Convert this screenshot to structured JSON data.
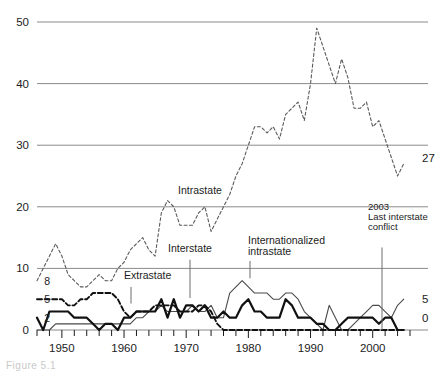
{
  "figure": {
    "caption": "Figure  5.1"
  },
  "chart_data": {
    "type": "line",
    "title": "",
    "xlabel": "",
    "ylabel": "",
    "xlim": [
      1946,
      2006
    ],
    "ylim": [
      0,
      50
    ],
    "grid": true,
    "gridlines_y": [
      0,
      10,
      20,
      30,
      40,
      50
    ],
    "legend_position": "inline-annotations",
    "y_tick_labels": [
      "50",
      "40",
      "30",
      "20",
      "10",
      "0"
    ],
    "y_minor_labels": [
      "8",
      "5",
      "2"
    ],
    "x_tick_labels": [
      "1950",
      "1960",
      "1970",
      "1980",
      "1990",
      "2000"
    ],
    "x_tick_interval_years": 2,
    "end_labels": [
      {
        "series": "Intrastate",
        "value": "27"
      },
      {
        "series": "Internationalized intrastate",
        "value": "5"
      },
      {
        "series": "Interstate",
        "value": "0"
      }
    ],
    "start_labels": [
      {
        "series": "Intrastate",
        "value": "8"
      },
      {
        "series": "Extrastate",
        "value": "5"
      },
      {
        "series": "Interstate",
        "value": "2"
      }
    ],
    "annotations": [
      {
        "name": "intrastate-label",
        "text": "Intrastate",
        "x": 1967,
        "y": 22.0
      },
      {
        "name": "interstate-label",
        "text": "Interstate",
        "x": 1969,
        "y": 12.5
      },
      {
        "name": "internationalized-intrastate-label",
        "text": "Internationalized\nintrastate",
        "x": 1979,
        "y": 13.5
      },
      {
        "name": "extrastate-label",
        "text": "Extrastate",
        "x": 1959,
        "y": 9.0
      },
      {
        "name": "event-2003",
        "text": "2003\nLast interstate\nconflict",
        "x": 2003,
        "y": 18.0
      }
    ],
    "x": [
      1946,
      1947,
      1948,
      1949,
      1950,
      1951,
      1952,
      1953,
      1954,
      1955,
      1956,
      1957,
      1958,
      1959,
      1960,
      1961,
      1962,
      1963,
      1964,
      1965,
      1966,
      1967,
      1968,
      1969,
      1970,
      1971,
      1972,
      1973,
      1974,
      1975,
      1976,
      1977,
      1978,
      1979,
      1980,
      1981,
      1982,
      1983,
      1984,
      1985,
      1986,
      1987,
      1988,
      1989,
      1990,
      1991,
      1992,
      1993,
      1994,
      1995,
      1996,
      1997,
      1998,
      1999,
      2000,
      2001,
      2002,
      2003,
      2004,
      2005
    ],
    "series": [
      {
        "name": "Intrastate",
        "style": "dashed-thin",
        "values": [
          8,
          10,
          12,
          14,
          12,
          9,
          8,
          7,
          7,
          8,
          9,
          8,
          8,
          10,
          11,
          13,
          14,
          15,
          13,
          12,
          19,
          21,
          20,
          17,
          17,
          17,
          19,
          20,
          16,
          18,
          20,
          22,
          25,
          27,
          30,
          33,
          33,
          32,
          33,
          31,
          35,
          36,
          37,
          34,
          40,
          49,
          46,
          43,
          40,
          44,
          41,
          36,
          36,
          37,
          33,
          34,
          31,
          28,
          25,
          27
        ]
      },
      {
        "name": "Internationalized intrastate",
        "style": "solid-thin",
        "values": [
          0,
          0,
          0,
          1,
          1,
          1,
          1,
          1,
          1,
          1,
          1,
          1,
          1,
          1,
          1,
          1,
          2,
          2,
          3,
          3,
          4,
          3,
          3,
          3,
          3,
          4,
          3,
          3,
          4,
          2,
          2,
          6,
          7,
          8,
          7,
          6,
          6,
          6,
          5,
          5,
          6,
          6,
          5,
          3,
          2,
          1,
          0,
          4,
          2,
          0,
          0,
          1,
          2,
          3,
          4,
          4,
          3,
          2,
          4,
          5
        ]
      },
      {
        "name": "Extrastate",
        "style": "dashed-thick",
        "values": [
          5,
          5,
          5,
          5,
          5,
          4,
          4,
          5,
          5,
          6,
          6,
          6,
          6,
          5,
          3,
          2,
          3,
          3,
          3,
          4,
          4,
          4,
          4,
          3,
          3,
          3,
          4,
          4,
          3,
          1,
          0,
          0,
          0,
          0,
          0,
          0,
          0,
          0,
          0,
          0,
          0,
          0,
          0,
          0,
          0,
          0,
          0,
          0,
          0,
          0,
          0,
          0,
          0,
          0,
          0,
          0,
          0,
          0,
          0,
          0
        ]
      },
      {
        "name": "Interstate",
        "style": "solid-thick",
        "values": [
          2,
          0,
          3,
          3,
          3,
          3,
          2,
          2,
          2,
          1,
          0,
          1,
          1,
          0,
          2,
          2,
          3,
          3,
          3,
          3,
          5,
          2,
          5,
          2,
          4,
          4,
          3,
          4,
          2,
          2,
          3,
          2,
          2,
          4,
          5,
          3,
          3,
          2,
          2,
          2,
          5,
          4,
          2,
          2,
          2,
          1,
          1,
          0,
          0,
          1,
          2,
          2,
          2,
          2,
          2,
          1,
          2,
          2,
          0,
          0
        ]
      }
    ]
  }
}
